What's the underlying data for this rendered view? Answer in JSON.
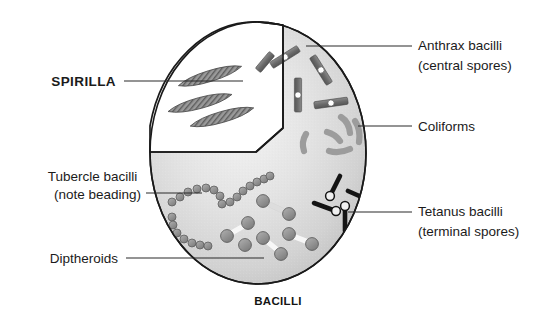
{
  "figure": {
    "caption": "BACILLI",
    "field_shape": "circle",
    "background_color": "#ffffff"
  },
  "colors": {
    "field_fill_light": "#f2f2f2",
    "field_fill_mid": "#d9d9d9",
    "field_fill_dark": "#c4c4c4",
    "outline": "#1a1a1a",
    "leader_line": "#2a2a2a",
    "text": "#1b1b1b",
    "anthrax_body": "#6e6e6e",
    "anthrax_spore": "#ffffff",
    "coliform_body": "#9a9a9a",
    "tetanus_body": "#141414",
    "tubercle_bead": "#8a8a8a",
    "diptheroid_knob": "#909090",
    "diptheroid_bar": "#f5f5f5",
    "spirilla_body": "#8c8c8c",
    "wedge_fill": "#ffffff"
  },
  "labels": [
    {
      "id": "spirilla",
      "lines": [
        "SPIRILLA"
      ],
      "bold": true,
      "side": "left",
      "text_anchor": "end",
      "text_x": 116,
      "text_y": 86,
      "leader": [
        [
          124,
          81
        ],
        [
          243,
          81
        ]
      ]
    },
    {
      "id": "tubercle-bacilli",
      "lines": [
        "Tubercle bacilli",
        "(note beading)"
      ],
      "bold": false,
      "side": "left",
      "text_anchor": "end",
      "text_x": 141,
      "text_y": 181,
      "leader": [
        [
          146,
          193
        ],
        [
          200,
          193
        ]
      ]
    },
    {
      "id": "diptheroids",
      "lines": [
        "Diptheroids"
      ],
      "bold": false,
      "side": "left",
      "text_anchor": "end",
      "text_x": 118,
      "text_y": 263,
      "leader": [
        [
          126,
          258
        ],
        [
          262,
          258
        ]
      ]
    },
    {
      "id": "anthrax-bacilli",
      "lines": [
        "Anthrax bacilli",
        "(central spores)"
      ],
      "bold": false,
      "side": "right",
      "text_anchor": "start",
      "text_x": 418,
      "text_y": 50,
      "leader": [
        [
          306,
          46
        ],
        [
          412,
          46
        ]
      ]
    },
    {
      "id": "coliforms",
      "lines": [
        "Coliforms"
      ],
      "bold": false,
      "side": "right",
      "text_anchor": "start",
      "text_x": 418,
      "text_y": 131,
      "leader": [
        [
          364,
          126
        ],
        [
          412,
          126
        ]
      ]
    },
    {
      "id": "tetanus-bacilli",
      "lines": [
        "Tetanus bacilli",
        "(terminal spores)"
      ],
      "bold": false,
      "side": "right",
      "text_anchor": "start",
      "text_x": 418,
      "text_y": 216,
      "leader": [
        [
          350,
          212
        ],
        [
          412,
          212
        ]
      ]
    }
  ],
  "caption": {
    "text": "BACILLI",
    "x": 278,
    "y": 305
  },
  "field": {
    "center_x": 258,
    "center_y": 153,
    "radius_x": 108,
    "radius_y": 131
  },
  "spirilla_wedge": {
    "description": "white pie-slice cutaway in upper-left of field",
    "path": "M 258 22 L 258 22 L 283 25 L 283 130 L 258 152 L 150 152 L 150 130 A 108 131 0 0 1 258 22 Z"
  },
  "organisms": {
    "spirilla": {
      "count": 3,
      "shape": "helical spiral rod with diagonal hatching",
      "items": [
        {
          "cx": 207,
          "cy": 78,
          "len": 62,
          "w": 9,
          "angle": -17
        },
        {
          "cx": 199,
          "cy": 103,
          "len": 62,
          "w": 9,
          "angle": -14
        },
        {
          "cx": 220,
          "cy": 117,
          "len": 62,
          "w": 9,
          "angle": -16
        }
      ]
    },
    "anthrax_bacilli": {
      "count": 5,
      "shape": "rod with central white spore",
      "items": [
        {
          "cx": 285,
          "cy": 57,
          "len": 30,
          "w": 7,
          "angle": -32
        },
        {
          "cx": 321,
          "cy": 68,
          "len": 30,
          "w": 7,
          "angle": 55
        },
        {
          "cx": 298,
          "cy": 95,
          "len": 30,
          "w": 7,
          "angle": 90
        },
        {
          "cx": 330,
          "cy": 104,
          "len": 30,
          "w": 7,
          "angle": -10
        },
        {
          "cx": 264,
          "cy": 66,
          "len": 18,
          "w": 7,
          "angle": 58
        }
      ]
    },
    "coliforms": {
      "count": 5,
      "shape": "curved comma-shaped rod",
      "items": [
        {
          "cx": 330,
          "cy": 127,
          "r": 11,
          "w": 6,
          "angle": 150
        },
        {
          "cx": 350,
          "cy": 120,
          "r": 11,
          "w": 6,
          "angle": 220
        },
        {
          "cx": 352,
          "cy": 146,
          "r": 11,
          "w": 6,
          "angle": 10
        },
        {
          "cx": 325,
          "cy": 147,
          "r": 11,
          "w": 6,
          "angle": 40
        },
        {
          "cx": 305,
          "cy": 140,
          "r": 10,
          "w": 6,
          "angle": 110
        }
      ]
    },
    "tetanus_bacilli": {
      "count": 4,
      "shape": "drumstick rod with terminal round spore",
      "items": [
        {
          "x1": 338,
          "y1": 175,
          "x2": 330,
          "y2": 194,
          "spore_r": 4.5
        },
        {
          "x1": 365,
          "y1": 200,
          "x2": 345,
          "y2": 191,
          "spore_r": 4.5
        },
        {
          "x1": 315,
          "y1": 203,
          "x2": 334,
          "y2": 210,
          "spore_r": 4.5
        },
        {
          "x1": 345,
          "y1": 230,
          "x2": 345,
          "y2": 207,
          "spore_r": 4.5
        }
      ]
    },
    "tubercle_bacilli": {
      "count": 3,
      "shape": "chain of beads (beaded rod)",
      "items": [
        {
          "path": "M 173 200 Q 186 184 204 186 Q 216 188 221 196",
          "beads": 9
        },
        {
          "path": "M 231 201 Q 240 187 252 182 Q 262 179 268 176",
          "beads": 8
        },
        {
          "path": "M 172 217 Q 174 232 186 240 Q 196 246 205 247",
          "beads": 9
        }
      ]
    },
    "diptheroids": {
      "count": 5,
      "shape": "dumbbell: two knobs joined by pale bar",
      "items": [
        {
          "x1": 263,
          "y1": 201,
          "x2": 288,
          "y2": 213
        },
        {
          "x1": 248,
          "y1": 224,
          "x2": 227,
          "y2": 235
        },
        {
          "x1": 263,
          "y1": 238,
          "x2": 281,
          "y2": 253
        },
        {
          "x1": 289,
          "y1": 234,
          "x2": 312,
          "y2": 243
        },
        {
          "x1": 246,
          "y1": 243,
          "x2": 240,
          "y2": 245
        }
      ]
    }
  }
}
